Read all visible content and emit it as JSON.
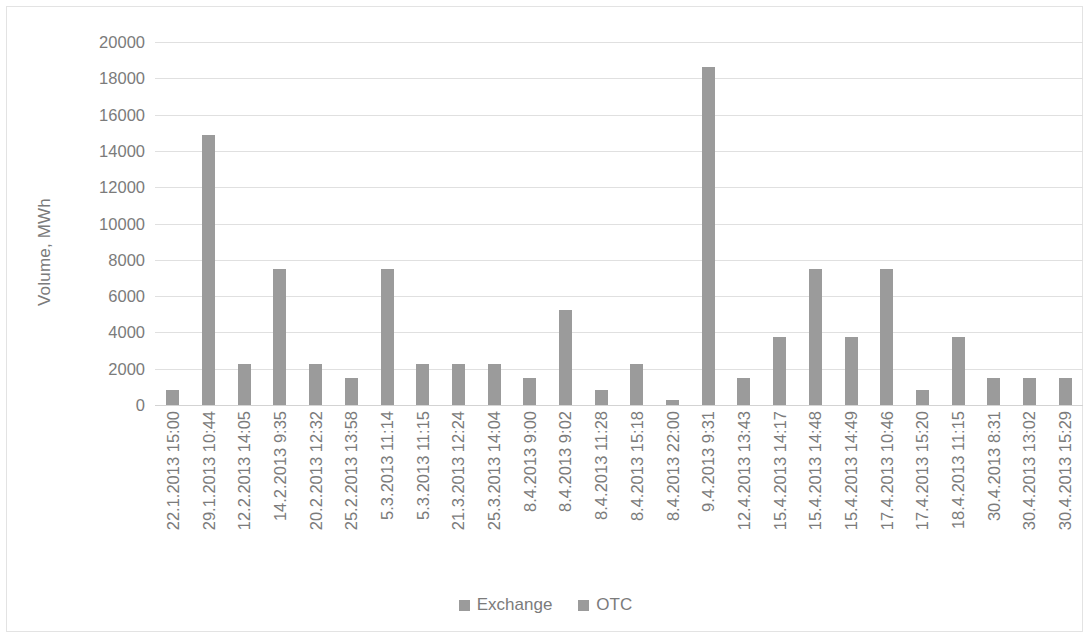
{
  "chart_data": {
    "type": "bar",
    "title": "",
    "subtitle": "",
    "xlabel": "",
    "ylabel": "Volume, MWh",
    "ylim": [
      0,
      20000
    ],
    "ytick_step": 2000,
    "yticks": [
      0,
      2000,
      4000,
      6000,
      8000,
      10000,
      12000,
      14000,
      16000,
      18000,
      20000
    ],
    "ytick_labels": [
      "0",
      "2000",
      "4000",
      "6000",
      "8000",
      "10000",
      "12000",
      "14000",
      "16000",
      "18000",
      "20000"
    ],
    "grid": true,
    "grid_axis": "y",
    "legend_position": "bottom",
    "legend": [
      "Exchange",
      "OTC"
    ],
    "bar_color": "#9b9b9b",
    "grid_color": "#e0e0e0",
    "text_color": "#7b7b7b",
    "categories": [
      "22.1.2013 15:00",
      "29.1.2013 10:44",
      "12.2.2013 14:05",
      "14.2.2013 9:35",
      "20.2.2013 12:32",
      "25.2.2013 13:58",
      "5.3.2013 11:14",
      "5.3.2013 11:15",
      "21.3.2013 12:24",
      "25.3.2013 14:04",
      "8.4.2013 9:00",
      "8.4.2013 9:02",
      "8.4.2013 11:28",
      "8.4.2013 15:18",
      "8.4.2013 22:00",
      "9.4.2013 9:31",
      "12.4.2013 13:43",
      "15.4.2013 14:17",
      "15.4.2013 14:48",
      "15.4.2013 14:49",
      "17.4.2013 10:46",
      "17.4.2013 15:20",
      "18.4.2013 11:15",
      "30.4.2013 8:31",
      "30.4.2013 13:02",
      "30.4.2013 15:29"
    ],
    "series": [
      {
        "name": "Exchange",
        "values": [
          800,
          14850,
          2250,
          7500,
          2250,
          1500,
          7500,
          2250,
          2250,
          2250,
          1500,
          5250,
          800,
          2250,
          300,
          18650,
          1500,
          3750,
          7500,
          3750,
          7500,
          800,
          3750,
          1500,
          1500,
          1500
        ]
      }
    ]
  },
  "legend": {
    "items": [
      {
        "label": "Exchange",
        "color": "#9b9b9b"
      },
      {
        "label": "OTC",
        "color": "#9b9b9b"
      }
    ]
  }
}
